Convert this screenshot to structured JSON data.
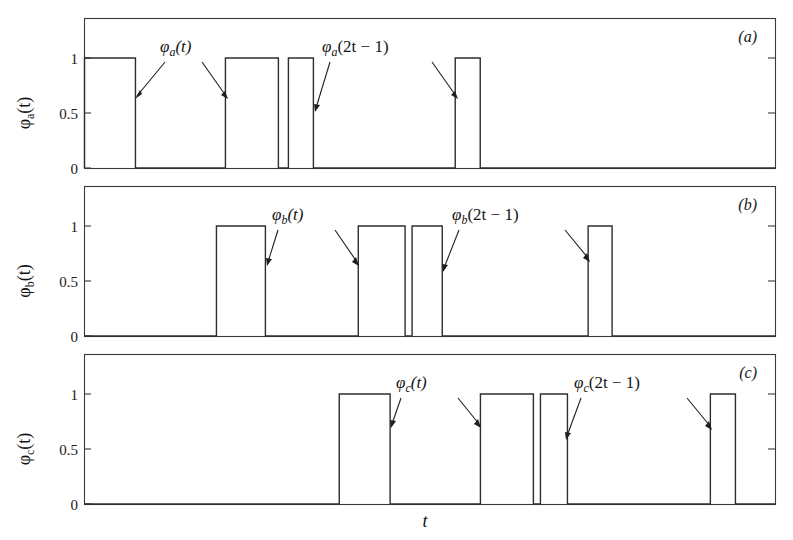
{
  "figure": {
    "background_color": "#ffffff",
    "line_color": "#2e2e2e",
    "xlabel": "t",
    "panels": [
      {
        "id": "a",
        "panel_label": "(a)",
        "ylabel_parts": {
          "phi": "φ",
          "sub": "a",
          "arg": "(t)"
        },
        "ytick_labels": [
          "0",
          "0.5",
          "1"
        ],
        "annotations": [
          {
            "text_phi": "φ",
            "text_sub": "a",
            "text_arg": "(t)"
          },
          {
            "text_phi": "φ",
            "text_sub": "a",
            "text_arg": "(2t − 1)"
          }
        ]
      },
      {
        "id": "b",
        "panel_label": "(b)",
        "ylabel_parts": {
          "phi": "φ",
          "sub": "b",
          "arg": "(t)"
        },
        "ytick_labels": [
          "0",
          "0.5",
          "1"
        ],
        "annotations": [
          {
            "text_phi": "φ",
            "text_sub": "b",
            "text_arg": "(t)"
          },
          {
            "text_phi": "φ",
            "text_sub": "b",
            "text_arg": "(2t − 1)"
          }
        ]
      },
      {
        "id": "c",
        "panel_label": "(c)",
        "ylabel_parts": {
          "phi": "φ",
          "sub": "c",
          "arg": "(t)"
        },
        "ytick_labels": [
          "0",
          "0.5",
          "1"
        ],
        "annotations": [
          {
            "text_phi": "φ",
            "text_sub": "c",
            "text_arg": "(t)"
          },
          {
            "text_phi": "φ",
            "text_sub": "c",
            "text_arg": "(2t − 1)"
          }
        ]
      }
    ]
  },
  "chart_data": {
    "type": "line",
    "title": "",
    "xlabel": "t",
    "ylabel": "",
    "grid": false,
    "legend": "none",
    "xlim": [
      0,
      1
    ],
    "ylim": [
      -0.12,
      1.18
    ],
    "note": "Three stacked step-function (square pulse) panels. Values are binary 0/1 over normalized time t in [0,1].",
    "subplots": [
      {
        "id": "a",
        "panel_label": "(a)",
        "ylabel": "φ_a(t)",
        "yticks": [
          0,
          0.5,
          1
        ],
        "ytick_labels": [
          "0",
          "0.5",
          "1"
        ],
        "xlim": [
          0,
          1
        ],
        "ylim": [
          -0.12,
          1.18
        ],
        "pulses": [
          {
            "start": 0.0,
            "end": 0.0738,
            "value": 1
          },
          {
            "start": 0.2041,
            "end": 0.2808,
            "value": 1
          },
          {
            "start": 0.2953,
            "end": 0.3315,
            "value": 1
          },
          {
            "start": 0.5369,
            "end": 0.5731,
            "value": 1
          }
        ],
        "annotation_labels": [
          "φ_a(t)",
          "φ_a(2t − 1)"
        ]
      },
      {
        "id": "b",
        "panel_label": "(b)",
        "ylabel": "φ_b(t)",
        "yticks": [
          0,
          0.5,
          1
        ],
        "ytick_labels": [
          "0",
          "0.5",
          "1"
        ],
        "xlim": [
          0,
          1
        ],
        "ylim": [
          -0.12,
          1.18
        ],
        "pulses": [
          {
            "start": 0.1911,
            "end": 0.262,
            "value": 1
          },
          {
            "start": 0.3965,
            "end": 0.4643,
            "value": 1
          },
          {
            "start": 0.4744,
            "end": 0.5181,
            "value": 1
          },
          {
            "start": 0.7294,
            "end": 0.7641,
            "value": 1
          }
        ],
        "annotation_labels": [
          "φ_b(t)",
          "φ_b(2t − 1)"
        ]
      },
      {
        "id": "c",
        "panel_label": "(c)",
        "ylabel": "φ_c(t)",
        "yticks": [
          0,
          0.5,
          1
        ],
        "ytick_labels": [
          "0",
          "0.5",
          "1"
        ],
        "xlim": [
          0,
          1
        ],
        "ylim": [
          -0.12,
          1.18
        ],
        "pulses": [
          {
            "start": 0.3689,
            "end": 0.4426,
            "value": 1
          },
          {
            "start": 0.5734,
            "end": 0.6501,
            "value": 1
          },
          {
            "start": 0.6603,
            "end": 0.6994,
            "value": 1
          },
          {
            "start": 0.9064,
            "end": 0.9427,
            "value": 1
          }
        ],
        "annotation_labels": [
          "φ_c(t)",
          "φ_c(2t − 1)"
        ]
      }
    ]
  }
}
